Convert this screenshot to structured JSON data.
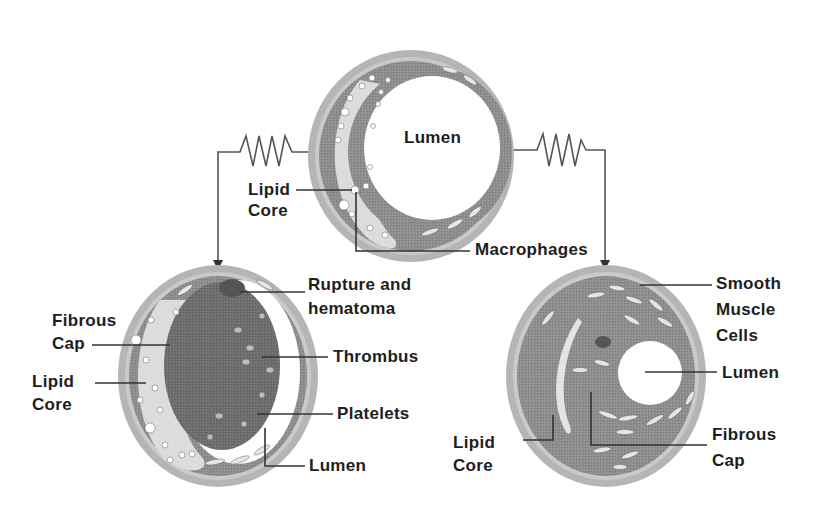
{
  "diagram": {
    "type": "atherosclerotic plaque progression",
    "colors": {
      "wall_outer": "#a9a9a9",
      "wall_rim": "#c4c4c4",
      "media": "#8c8c8c",
      "lipid": "#d9d9d9",
      "thrombus": "#6f6f6f",
      "lumen": "#ffffff",
      "line": "#333333",
      "text": "#1e1e1e"
    },
    "top_vessel": {
      "labels": {
        "lumen": "Lumen",
        "lipid_core_1": "Lipid",
        "lipid_core_2": "Core",
        "macrophages": "Macrophages"
      }
    },
    "left_vessel": {
      "labels": {
        "rupture_1": "Rupture and",
        "rupture_2": "hematoma",
        "fibrous_cap_1": "Fibrous",
        "fibrous_cap_2": "Cap",
        "thrombus": "Thrombus",
        "lipid_core_1": "Lipid",
        "lipid_core_2": "Core",
        "platelets": "Platelets",
        "lumen": "Lumen"
      }
    },
    "right_vessel": {
      "labels": {
        "smooth_muscle_1": "Smooth",
        "smooth_muscle_2": "Muscle",
        "smooth_muscle_3": "Cells",
        "lumen": "Lumen",
        "lipid_core_1": "Lipid",
        "lipid_core_2": "Core",
        "fibrous_cap_1": "Fibrous",
        "fibrous_cap_2": "Cap"
      }
    },
    "connectors": [
      {
        "from": "top_vessel",
        "to": "left_vessel",
        "style": "spring-arrow"
      },
      {
        "from": "top_vessel",
        "to": "right_vessel",
        "style": "spring-arrow"
      }
    ]
  }
}
